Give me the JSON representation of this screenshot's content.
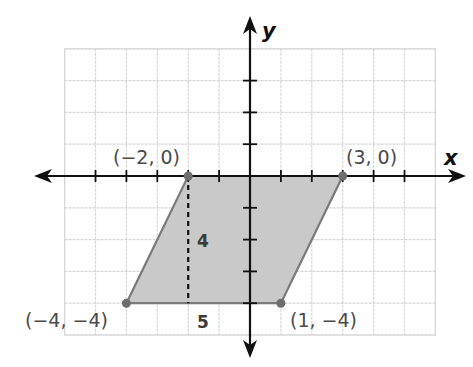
{
  "diagram": {
    "type": "coordinate-plane",
    "axes": {
      "x_label": "x",
      "y_label": "y",
      "x_range": [
        -6,
        6
      ],
      "y_range": [
        -5,
        4
      ]
    },
    "grid": {
      "color": "#d6d6d6",
      "style": "dashed"
    },
    "shape": {
      "name": "parallelogram",
      "fill": "#c9c9c9",
      "stroke": "#7a7a7a",
      "vertices": [
        {
          "x": -2,
          "y": 0,
          "label": "(−2, 0)"
        },
        {
          "x": 3,
          "y": 0,
          "label": "(3, 0)"
        },
        {
          "x": 1,
          "y": -4,
          "label": "(1, −4)"
        },
        {
          "x": -4,
          "y": -4,
          "label": "(−4, −4)"
        }
      ]
    },
    "height_segment": {
      "from": [
        -2,
        0
      ],
      "to": [
        -2,
        -4
      ],
      "style": "dashed",
      "label": "4"
    },
    "base_label": "5"
  }
}
